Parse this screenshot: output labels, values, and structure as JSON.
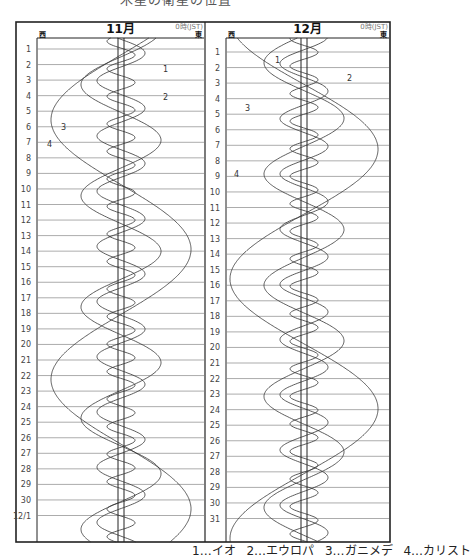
{
  "header_partial": "木星の衛星の位置",
  "legend": [
    {
      "num": "1",
      "name": "イオ",
      "label": "1…イオ"
    },
    {
      "num": "2",
      "name": "エウロパ",
      "label": "2…エウロパ"
    },
    {
      "num": "3",
      "name": "ガニメデ",
      "label": "3…ガニメデ"
    },
    {
      "num": "4",
      "name": "カリスト",
      "label": "4…カリスト"
    }
  ],
  "panels": [
    {
      "title": "11月",
      "time_note": "0時(JST)",
      "west_label": "西",
      "east_label": "東",
      "row_labels": [
        "1",
        "2",
        "3",
        "4",
        "5",
        "6",
        "7",
        "8",
        "9",
        "10",
        "11",
        "12",
        "13",
        "14",
        "15",
        "16",
        "17",
        "18",
        "19",
        "20",
        "21",
        "22",
        "23",
        "24",
        "25",
        "26",
        "27",
        "28",
        "29",
        "30",
        "12/1"
      ],
      "annotations": [
        {
          "num": "1",
          "x": 163,
          "y": 69
        },
        {
          "num": "2",
          "x": 163,
          "y": 97
        },
        {
          "num": "3",
          "x": 61,
          "y": 127
        },
        {
          "num": "4",
          "x": 47,
          "y": 144
        }
      ]
    },
    {
      "title": "12月",
      "time_note": "0時(JST)",
      "west_label": "西",
      "east_label": "東",
      "row_labels": [
        "1",
        "2",
        "3",
        "4",
        "5",
        "6",
        "7",
        "8",
        "9",
        "10",
        "11",
        "12",
        "13",
        "14",
        "15",
        "16",
        "17",
        "18",
        "19",
        "20",
        "21",
        "22",
        "23",
        "24",
        "25",
        "26",
        "27",
        "28",
        "29",
        "30",
        "31"
      ],
      "annotations": [
        {
          "num": "1",
          "x": 275,
          "y": 60
        },
        {
          "num": "2",
          "x": 347,
          "y": 78
        },
        {
          "num": "3",
          "x": 245,
          "y": 108
        },
        {
          "num": "4",
          "x": 234,
          "y": 174
        }
      ]
    }
  ],
  "colors": {
    "line": "#333333",
    "grid": "#888888",
    "frame": "#222222"
  }
}
